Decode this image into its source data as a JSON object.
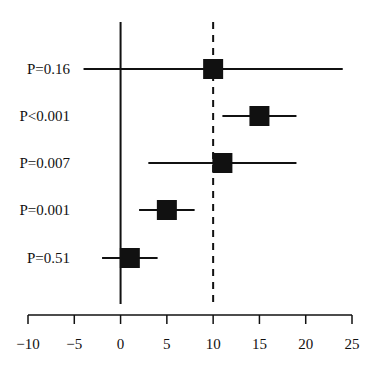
{
  "chart_data": {
    "type": "forest",
    "title": "",
    "xlabel": "",
    "ylabel": "",
    "xlim": [
      -10,
      25
    ],
    "x_ticks": [
      -10,
      -5,
      0,
      5,
      10,
      15,
      20,
      25
    ],
    "x_tick_labels": [
      "−10",
      "−5",
      "0",
      "5",
      "10",
      "15",
      "20",
      "25"
    ],
    "reference_lines": [
      {
        "x": 0,
        "style": "solid"
      },
      {
        "x": 10,
        "style": "dashed"
      }
    ],
    "rows": [
      {
        "label": "P=0.16",
        "estimate": 10,
        "ci_low": -4,
        "ci_high": 24
      },
      {
        "label": "P<0.001",
        "estimate": 15,
        "ci_low": 11,
        "ci_high": 19
      },
      {
        "label": "P=0.007",
        "estimate": 11,
        "ci_low": 3,
        "ci_high": 19
      },
      {
        "label": "P=0.001",
        "estimate": 5,
        "ci_low": 2,
        "ci_high": 8
      },
      {
        "label": "P=0.51",
        "estimate": 1,
        "ci_low": -2,
        "ci_high": 4
      }
    ],
    "grid": false,
    "legend": null
  },
  "colors": {
    "ink": "#111111",
    "background": "#ffffff"
  }
}
